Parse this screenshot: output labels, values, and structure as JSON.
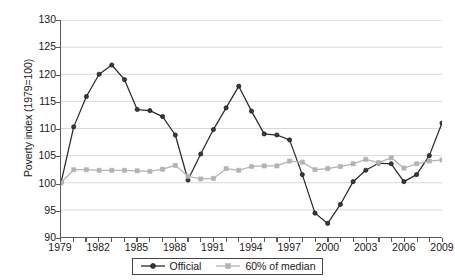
{
  "chart_data": {
    "type": "line",
    "title": "",
    "xlabel": "",
    "ylabel": "Poverty index (1979=100)",
    "xlim": [
      1979,
      2009
    ],
    "ylim": [
      90,
      130
    ],
    "yticks": [
      90,
      95,
      100,
      105,
      110,
      115,
      120,
      125,
      130
    ],
    "xticks": [
      1979,
      1982,
      1985,
      1988,
      1991,
      1994,
      1997,
      2000,
      2003,
      2006,
      2009
    ],
    "grid": "horizontal",
    "legend_position": "bottom-center",
    "x": [
      1979,
      1980,
      1981,
      1982,
      1983,
      1984,
      1985,
      1986,
      1987,
      1988,
      1989,
      1990,
      1991,
      1992,
      1993,
      1994,
      1995,
      1996,
      1997,
      1998,
      1999,
      2000,
      2001,
      2002,
      2003,
      2004,
      2005,
      2006,
      2007,
      2008,
      2009
    ],
    "series": [
      {
        "name": "Official",
        "color": "#2b2b2b",
        "marker": "circle",
        "values": [
          100.0,
          110.3,
          115.9,
          120.0,
          121.7,
          119.0,
          113.5,
          113.3,
          112.2,
          108.8,
          100.5,
          105.3,
          109.8,
          113.8,
          117.8,
          113.2,
          109.0,
          108.8,
          107.9,
          101.5,
          94.4,
          92.5,
          96.0,
          100.2,
          102.3,
          103.6,
          103.5,
          100.2,
          101.5,
          105.0,
          111.0
        ]
      },
      {
        "name": "60% of median",
        "color": "#b3b3b3",
        "marker": "square",
        "values": [
          100.0,
          102.4,
          102.4,
          102.3,
          102.3,
          102.3,
          102.2,
          102.1,
          102.5,
          103.2,
          101.2,
          100.7,
          100.8,
          102.6,
          102.3,
          103.0,
          103.1,
          103.1,
          104.0,
          103.8,
          102.4,
          102.6,
          103.0,
          103.5,
          104.3,
          103.7,
          104.6,
          102.7,
          103.5,
          104.0,
          104.2
        ]
      }
    ]
  },
  "legend": {
    "entries": [
      {
        "label": "Official"
      },
      {
        "label": "60% of median"
      }
    ]
  }
}
